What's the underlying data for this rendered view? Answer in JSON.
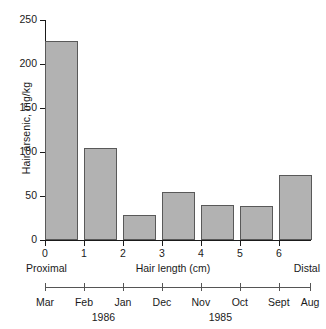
{
  "chart_data": {
    "type": "bar",
    "title": "",
    "xlabel": "Hair length (cm)",
    "ylabel": "Hair arsenic, mg/kg",
    "ylim": [
      0,
      250
    ],
    "xlim": [
      0,
      6.8
    ],
    "grid": false,
    "legend": null,
    "bar_left_edges": [
      0,
      1,
      2,
      3,
      4,
      5,
      6
    ],
    "bar_width": 0.85,
    "categories": [
      "0-1",
      "1-2",
      "2-3",
      "3-4",
      "4-5",
      "5-6",
      "6-7"
    ],
    "values": [
      226,
      104,
      28,
      55,
      40,
      39,
      74
    ],
    "ytick_labels": [
      "0",
      "50",
      "100",
      "150",
      "200",
      "250"
    ],
    "ytick_values": [
      0,
      50,
      100,
      150,
      200,
      250
    ],
    "xtick_labels": [
      "0",
      "1",
      "2",
      "3",
      "4",
      "5",
      "6"
    ],
    "xtick_values": [
      0,
      1,
      2,
      3,
      4,
      5,
      6
    ],
    "annotations": {
      "proximal": "Proximal",
      "distal": "Distal"
    },
    "secondary_axis": {
      "name": "month-scale",
      "tick_labels": [
        "Mar",
        "Feb",
        "Jan",
        "Dec",
        "Nov",
        "Oct",
        "Sept",
        "Aug"
      ],
      "tick_values": [
        0,
        1,
        2,
        3,
        4,
        5,
        6,
        6.8
      ],
      "year_labels": [
        {
          "text": "1986",
          "at": 1.5
        },
        {
          "text": "1985",
          "at": 4.5
        }
      ]
    },
    "colors": {
      "bar_fill": "#b2b2b2",
      "bar_edge": "#595959",
      "axis": "#1a1a1a",
      "text": "#1a1a1a",
      "background": "#ffffff"
    }
  }
}
